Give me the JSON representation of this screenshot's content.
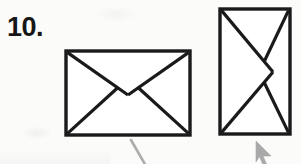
{
  "page": {
    "kind": "scanned-worksheet-question",
    "background_color": "#fbfbfa",
    "ink_color": "#1a1a1a",
    "pencil_color": "#9a9a9a",
    "width": 301,
    "height": 164
  },
  "question": {
    "number_label": "10.",
    "prompt_text": ""
  },
  "figures": [
    {
      "id": "figure-1",
      "name": "envelope-landscape",
      "orientation": "landscape",
      "rect": {
        "x": 66,
        "y": 51,
        "width": 124,
        "height": 84
      },
      "stroke_width": 3.2,
      "flap_vertex": {
        "x": 128,
        "y": 95
      },
      "left_peak": {
        "x": 118,
        "y": 87
      },
      "right_peak": {
        "x": 138,
        "y": 87
      }
    },
    {
      "id": "figure-2",
      "name": "envelope-portrait",
      "orientation": "portrait",
      "rect": {
        "x": 220,
        "y": 9,
        "width": 70,
        "height": 125
      },
      "stroke_width": 3.2,
      "flap_vertex": {
        "x": 273,
        "y": 72
      },
      "top_peak": {
        "x": 264,
        "y": 62
      },
      "bottom_peak": {
        "x": 264,
        "y": 82
      }
    }
  ],
  "annotations": [
    {
      "id": "pencil-stroke-1",
      "name": "pencil-mark-diagonal",
      "description": "faint gray diagonal pencil stroke",
      "x1": 131,
      "y1": 140,
      "x2": 145,
      "y2": 164,
      "color": "#9a9a9a"
    }
  ],
  "cursor": {
    "name": "mouse-cursor-arrow",
    "x": 256,
    "y": 141,
    "color": "#8c8c8c",
    "direction": "up-right"
  }
}
